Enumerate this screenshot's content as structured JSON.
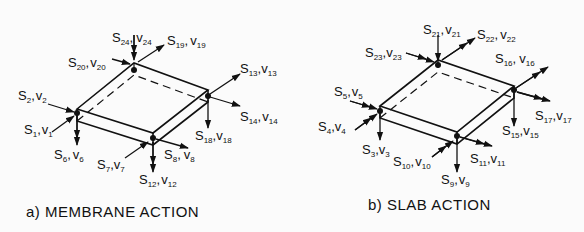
{
  "figures": [
    {
      "id": "membrane",
      "caption": "a)  MEMBRANE  ACTION",
      "nodes": [
        {
          "corner": "left",
          "labels": [
            "S1,v1",
            "S2,v2",
            "S6,v6"
          ]
        },
        {
          "corner": "top",
          "labels": [
            "S19,v19",
            "S20,v20",
            "S24,v24"
          ]
        },
        {
          "corner": "right",
          "labels": [
            "S13,v13",
            "S14,v14",
            "S18,v18"
          ]
        },
        {
          "corner": "front",
          "labels": [
            "S7,v7",
            "S8,v8",
            "S12,v12"
          ]
        }
      ],
      "labels": {
        "s1": {
          "S": "S",
          "n": "1",
          "v": "v",
          "m": "1"
        },
        "s2": {
          "S": "S",
          "n": "2",
          "v": "v",
          "m": "2"
        },
        "s6": {
          "S": "S",
          "n": "6",
          "v": "v",
          "m": "6"
        },
        "s7": {
          "S": "S",
          "n": "7",
          "v": "v",
          "m": "7"
        },
        "s8": {
          "S": "S",
          "n": "8",
          "v": "v",
          "m": "8"
        },
        "s12": {
          "S": "S",
          "n": "12",
          "v": "v",
          "m": "12"
        },
        "s13": {
          "S": "S",
          "n": "13",
          "v": "v",
          "m": "13"
        },
        "s14": {
          "S": "S",
          "n": "14",
          "v": "v",
          "m": "14"
        },
        "s18": {
          "S": "S",
          "n": "18",
          "v": "v",
          "m": "18"
        },
        "s19": {
          "S": "S",
          "n": "19",
          "v": "v",
          "m": "19"
        },
        "s20": {
          "S": "S",
          "n": "20",
          "v": "v",
          "m": "20"
        },
        "s24": {
          "S": "S",
          "n": "24",
          "v": "v",
          "m": "24"
        }
      }
    },
    {
      "id": "slab",
      "caption": "b)  SLAB  ACTION",
      "nodes": [
        {
          "corner": "left",
          "labels": [
            "S3,v3",
            "S4,v4",
            "S5,v5"
          ]
        },
        {
          "corner": "top",
          "labels": [
            "S21,v21",
            "S22,v22",
            "S23,v23"
          ]
        },
        {
          "corner": "right",
          "labels": [
            "S15,v15",
            "S16,v16",
            "S17,v17"
          ]
        },
        {
          "corner": "front",
          "labels": [
            "S9,v9",
            "S10,v10",
            "S11,v11"
          ]
        }
      ],
      "labels": {
        "s3": {
          "S": "S",
          "n": "3",
          "v": "v",
          "m": "3"
        },
        "s4": {
          "S": "S",
          "n": "4",
          "v": "v",
          "m": "4"
        },
        "s5": {
          "S": "S",
          "n": "5",
          "v": "v",
          "m": "5"
        },
        "s9": {
          "S": "S",
          "n": "9",
          "v": "v",
          "m": "9"
        },
        "s10": {
          "S": "S",
          "n": "10",
          "v": "v",
          "m": "10"
        },
        "s11": {
          "S": "S",
          "n": "11",
          "v": "v",
          "m": "11"
        },
        "s15": {
          "S": "S",
          "n": "15",
          "v": "v",
          "m": "15"
        },
        "s16": {
          "S": "S",
          "n": "16",
          "v": "v",
          "m": "16"
        },
        "s17": {
          "S": "S",
          "n": "17",
          "v": "v",
          "m": "17"
        },
        "s21": {
          "S": "S",
          "n": "21",
          "v": "v",
          "m": "21"
        },
        "s22": {
          "S": "S",
          "n": "22",
          "v": "v",
          "m": "22"
        },
        "s23": {
          "S": "S",
          "n": "23",
          "v": "v",
          "m": "23"
        }
      }
    }
  ],
  "comma": ","
}
